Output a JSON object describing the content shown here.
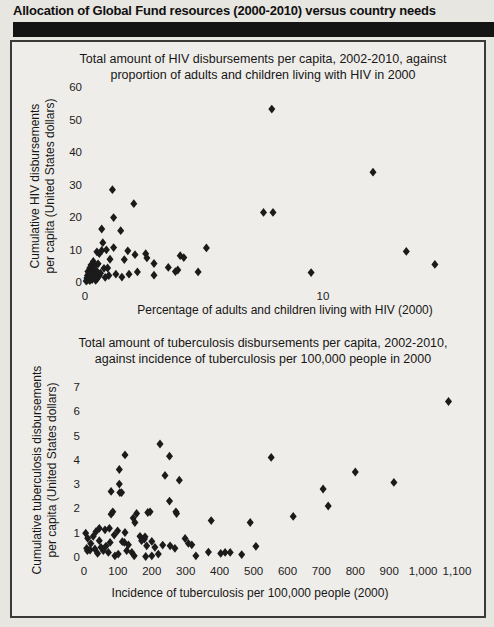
{
  "header": {
    "title": "Allocation of Global Fund resources (2000-2010) versus country needs"
  },
  "colors": {
    "marker": "#1b1b1b",
    "header_bar": "#141414",
    "paper": "#e8e6e1",
    "panel": "#efede9"
  },
  "chart_data": [
    {
      "type": "scatter",
      "title_line1": "Total amount of HIV disbursements per capita, 2002-2010, against",
      "title_line2": "proportion of adults and children living with HIV in 2000",
      "xlabel": "Percentage of adults and children living with HIV (2000)",
      "ylabel_line1": "Cumulative HIV disbursements",
      "ylabel_line2": "per capita (United States dollars)",
      "xlim": [
        0,
        16.5
      ],
      "ylim": [
        0,
        60
      ],
      "grid": false,
      "legend": "none",
      "marker": "diamond",
      "xticks": [
        0,
        10
      ],
      "xtick_labels": [
        "0",
        "10"
      ],
      "yticks": [
        0,
        10,
        20,
        30,
        40,
        50,
        60
      ],
      "points": [
        [
          0.05,
          0.3
        ],
        [
          0.08,
          1.2
        ],
        [
          0.1,
          0.6
        ],
        [
          0.1,
          2.0
        ],
        [
          0.12,
          3.2
        ],
        [
          0.15,
          0.9
        ],
        [
          0.15,
          1.7
        ],
        [
          0.18,
          2.6
        ],
        [
          0.2,
          0.4
        ],
        [
          0.2,
          4.3
        ],
        [
          0.22,
          1.1
        ],
        [
          0.25,
          2.2
        ],
        [
          0.25,
          5.2
        ],
        [
          0.3,
          0.7
        ],
        [
          0.3,
          1.8
        ],
        [
          0.3,
          3.6
        ],
        [
          0.35,
          2.9
        ],
        [
          0.35,
          6.3
        ],
        [
          0.4,
          1.3
        ],
        [
          0.4,
          4.8
        ],
        [
          0.45,
          0.5
        ],
        [
          0.45,
          2.4
        ],
        [
          0.5,
          1.0
        ],
        [
          0.5,
          3.3
        ],
        [
          0.5,
          9.3
        ],
        [
          0.55,
          5.6
        ],
        [
          0.6,
          1.9
        ],
        [
          0.6,
          8.7
        ],
        [
          0.65,
          2.7
        ],
        [
          0.7,
          9.7
        ],
        [
          0.7,
          16.3
        ],
        [
          0.75,
          12.1
        ],
        [
          0.8,
          4.2
        ],
        [
          0.85,
          1.4
        ],
        [
          0.9,
          9.9
        ],
        [
          0.95,
          4.3
        ],
        [
          1.0,
          2.0
        ],
        [
          1.05,
          7.0
        ],
        [
          1.15,
          28.4
        ],
        [
          1.2,
          19.8
        ],
        [
          1.2,
          10.6
        ],
        [
          1.3,
          2.4
        ],
        [
          1.5,
          15.8
        ],
        [
          1.55,
          1.5
        ],
        [
          1.65,
          6.9
        ],
        [
          1.8,
          9.6
        ],
        [
          1.85,
          2.4
        ],
        [
          2.05,
          24.1
        ],
        [
          2.1,
          8.4
        ],
        [
          2.2,
          3.1
        ],
        [
          2.55,
          8.7
        ],
        [
          2.6,
          7.4
        ],
        [
          2.9,
          5.7
        ],
        [
          2.9,
          2.1
        ],
        [
          3.5,
          4.5
        ],
        [
          3.8,
          3.2
        ],
        [
          3.9,
          3.7
        ],
        [
          4.0,
          8.1
        ],
        [
          4.15,
          7.5
        ],
        [
          4.75,
          3.1
        ],
        [
          5.1,
          10.5
        ],
        [
          7.5,
          21.4
        ],
        [
          7.85,
          53.2
        ],
        [
          7.9,
          21.4
        ],
        [
          9.5,
          2.9
        ],
        [
          12.1,
          33.8
        ],
        [
          13.5,
          9.4
        ],
        [
          14.7,
          5.4
        ]
      ]
    },
    {
      "type": "scatter",
      "title_line1": "Total amount of tuberculosis disbursements per capita, 2002-2010,",
      "title_line2": "against incidence of tuberculosis per 100,000 people in 2000",
      "xlabel": "Incidence of tuberculosis per 100,000 people (2000)",
      "ylabel_line1": "Cumulative tuberculosis disbursements",
      "ylabel_line2": "per capita (United States dollars)",
      "xlim": [
        0,
        1150
      ],
      "ylim": [
        0,
        7
      ],
      "grid": false,
      "legend": "none",
      "marker": "diamond",
      "xticks": [
        0,
        100,
        200,
        300,
        400,
        500,
        600,
        700,
        800,
        900,
        1000,
        1100
      ],
      "xtick_labels": [
        "0",
        "100",
        "200",
        "300",
        "400",
        "500",
        "600",
        "700",
        "800",
        "900",
        "1,000",
        "1,100"
      ],
      "yticks": [
        0,
        1,
        2,
        3,
        4,
        5,
        6,
        7
      ],
      "points": [
        [
          5,
          0.98
        ],
        [
          8,
          0.36
        ],
        [
          10,
          0.26
        ],
        [
          11,
          0.77
        ],
        [
          18,
          0.29
        ],
        [
          20,
          0.55
        ],
        [
          27,
          0.85
        ],
        [
          32,
          0.33
        ],
        [
          35,
          1.04
        ],
        [
          40,
          0.15
        ],
        [
          45,
          1.18
        ],
        [
          45,
          0.67
        ],
        [
          50,
          0.4
        ],
        [
          57,
          0.26
        ],
        [
          62,
          1.12
        ],
        [
          65,
          0.45
        ],
        [
          72,
          0.19
        ],
        [
          75,
          1.18
        ],
        [
          77,
          0.6
        ],
        [
          80,
          2.7
        ],
        [
          80,
          1.76
        ],
        [
          85,
          1.86
        ],
        [
          89,
          0.9
        ],
        [
          91,
          0.05
        ],
        [
          99,
          1.08
        ],
        [
          101,
          0.12
        ],
        [
          104,
          3.6
        ],
        [
          104,
          3.0
        ],
        [
          106,
          2.65
        ],
        [
          111,
          2.65
        ],
        [
          113,
          0.63
        ],
        [
          119,
          0.6
        ],
        [
          121,
          4.2
        ],
        [
          121,
          1.01
        ],
        [
          126,
          0.26
        ],
        [
          131,
          0.5
        ],
        [
          141,
          0.19
        ],
        [
          145,
          1.6
        ],
        [
          148,
          0.05
        ],
        [
          150,
          1.42
        ],
        [
          155,
          1.79
        ],
        [
          165,
          0.85
        ],
        [
          170,
          0.67
        ],
        [
          178,
          0.74
        ],
        [
          180,
          0.83
        ],
        [
          182,
          0.02
        ],
        [
          185,
          0.46
        ],
        [
          188,
          1.83
        ],
        [
          195,
          1.86
        ],
        [
          200,
          0.64
        ],
        [
          200,
          0.05
        ],
        [
          209,
          0.4
        ],
        [
          219,
          0.12
        ],
        [
          224,
          4.65
        ],
        [
          232,
          0.49
        ],
        [
          239,
          3.36
        ],
        [
          252,
          4.15
        ],
        [
          252,
          2.3
        ],
        [
          254,
          0.46
        ],
        [
          268,
          0.36
        ],
        [
          271,
          1.86
        ],
        [
          273,
          1.79
        ],
        [
          281,
          3.16
        ],
        [
          298,
          0.76
        ],
        [
          308,
          0.56
        ],
        [
          318,
          0.5
        ],
        [
          330,
          0.05
        ],
        [
          367,
          0.2
        ],
        [
          375,
          1.5
        ],
        [
          403,
          0.15
        ],
        [
          416,
          0.19
        ],
        [
          431,
          0.19
        ],
        [
          465,
          0.1
        ],
        [
          490,
          1.42
        ],
        [
          507,
          0.44
        ],
        [
          552,
          4.1
        ],
        [
          617,
          1.67
        ],
        [
          705,
          2.8
        ],
        [
          720,
          2.1
        ],
        [
          800,
          3.5
        ],
        [
          914,
          3.07
        ],
        [
          1075,
          6.4
        ]
      ]
    }
  ]
}
